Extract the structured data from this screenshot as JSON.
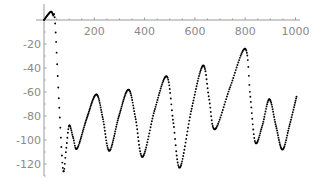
{
  "chart_data": {
    "type": "line",
    "title": "",
    "xlabel": "",
    "ylabel": "",
    "xlim": [
      0,
      1000
    ],
    "ylim": [
      -130,
      10
    ],
    "grid": false,
    "legend": null,
    "x_ticks": [
      200,
      400,
      600,
      800,
      1000
    ],
    "x_tick_labels": [
      "200",
      "400",
      "600",
      "800",
      "1000"
    ],
    "y_ticks": [
      -20,
      -40,
      -60,
      -80,
      -100,
      -120
    ],
    "y_tick_labels": [
      "-20",
      "-40",
      "-60",
      "-80",
      "-100",
      "-120"
    ],
    "series": [
      {
        "name": "curve",
        "color": "#000000",
        "style": "dotted-points",
        "x": [
          0,
          14,
          28,
          36,
          44,
          60,
          76,
          88,
          100,
          116,
          132,
          170,
          208,
          234,
          260,
          298,
          336,
          364,
          392,
          440,
          488,
          514,
          540,
          586,
          632,
          656,
          680,
          740,
          800,
          820,
          840,
          868,
          896,
          922,
          948,
          976,
          1004
        ],
        "y": [
          0,
          4,
          7,
          4,
          -2,
          -70,
          -125,
          -108,
          -88,
          -98,
          -107,
          -82,
          -62,
          -82,
          -109,
          -80,
          -58,
          -82,
          -114,
          -75,
          -47,
          -85,
          -123,
          -75,
          -38,
          -65,
          -91,
          -56,
          -24,
          -63,
          -102,
          -88,
          -66,
          -88,
          -108,
          -88,
          -64
        ]
      }
    ]
  },
  "axes": {
    "x_labels": [
      "200",
      "400",
      "600",
      "800",
      "1000"
    ],
    "y_labels": [
      "-20",
      "-40",
      "-60",
      "-80",
      "-100",
      "-120"
    ]
  }
}
